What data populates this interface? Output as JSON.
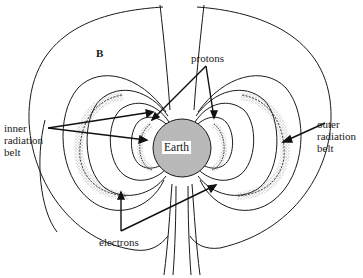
{
  "diagram": {
    "type": "magnetosphere radiation belts",
    "colors": {
      "earth_fill": "#b9b9b9",
      "line": "#1a1a1a",
      "stipple": "#8a8a8a",
      "background": "#ffffff"
    },
    "labels": {
      "field_label": "B",
      "protons": "protons",
      "earth": "Earth",
      "inner_belt_line1": "inner",
      "inner_belt_line2": "radiation",
      "inner_belt_line3": "belt",
      "outer_belt_line1": "outer",
      "outer_belt_line2": "radiation",
      "outer_belt_line3": "belt",
      "electrons": "electrons"
    }
  }
}
